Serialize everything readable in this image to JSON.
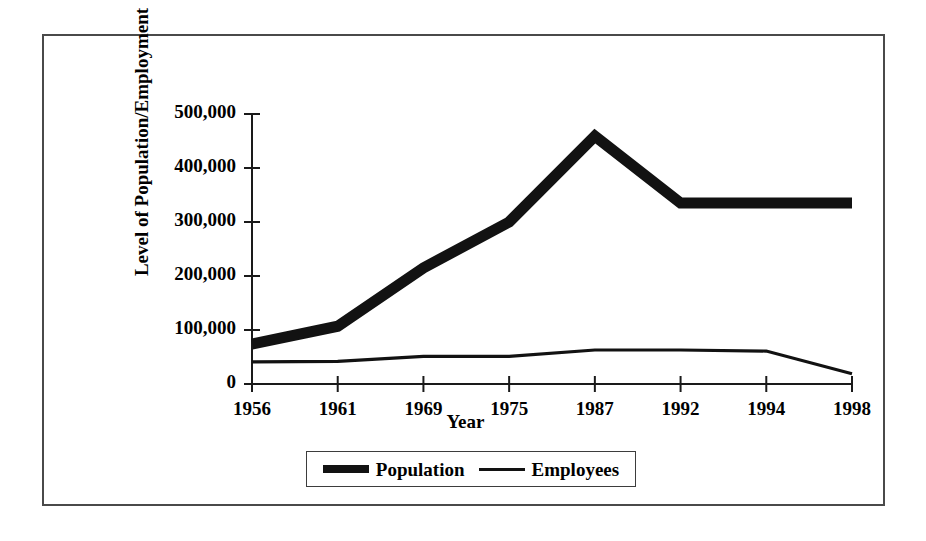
{
  "chart_data": {
    "type": "line",
    "title": "",
    "xlabel": "Year",
    "ylabel": "Level of Population/Employment",
    "categories": [
      "1956",
      "1961",
      "1969",
      "1975",
      "1987",
      "1992",
      "1994",
      "1998"
    ],
    "x": [
      1956,
      1961,
      1969,
      1975,
      1987,
      1992,
      1994,
      1998
    ],
    "ylim": [
      0,
      500000
    ],
    "yticks": [
      0,
      100000,
      200000,
      300000,
      400000,
      500000
    ],
    "ytick_labels": [
      "0",
      "100,000",
      "200,000",
      "300,000",
      "400,000",
      "500,000"
    ],
    "grid": false,
    "legend_position": "bottom",
    "series": [
      {
        "name": "Population",
        "style": "thick",
        "color": "#121212",
        "values": [
          74000,
          107000,
          215000,
          300000,
          459000,
          335000,
          335000,
          335000
        ]
      },
      {
        "name": "Employees",
        "style": "thin",
        "color": "#121212",
        "values": [
          41000,
          42000,
          51000,
          51000,
          63000,
          63000,
          61000,
          19000
        ]
      }
    ]
  },
  "legend": {
    "entries": [
      {
        "label": "Population",
        "swatch": "thick-line-swatch"
      },
      {
        "label": "Employees",
        "swatch": "thin-line-swatch"
      }
    ]
  }
}
